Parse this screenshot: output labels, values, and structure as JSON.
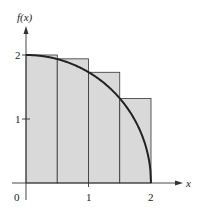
{
  "chart_data": {
    "type": "bar",
    "title": "",
    "xlabel": "x",
    "ylabel": "f(x)",
    "function": "f(x) = sqrt(4 - x^2)",
    "x_ticks": [
      "0",
      "1",
      "2"
    ],
    "y_ticks": [
      "1",
      "2"
    ],
    "xlim": [
      0,
      2
    ],
    "ylim": [
      0,
      2
    ],
    "rectangles": [
      {
        "x0": 0.0,
        "x1": 0.5,
        "height": 2.0
      },
      {
        "x0": 0.5,
        "x1": 1.0,
        "height": 1.94
      },
      {
        "x0": 1.0,
        "x1": 1.5,
        "height": 1.73
      },
      {
        "x0": 1.5,
        "x1": 2.0,
        "height": 1.32
      }
    ],
    "categories": [
      "[0,0.5]",
      "[0.5,1]",
      "[1,1.5]",
      "[1.5,2]"
    ],
    "values": [
      2.0,
      1.94,
      1.73,
      1.32
    ],
    "grid": false,
    "colors": {
      "fill": "#d9d9d9",
      "curve": "#222222",
      "axis": "#333333"
    }
  },
  "labels": {
    "ylabel": "f(x)",
    "xlabel": "x",
    "origin": "0",
    "x1": "1",
    "x2": "2",
    "y1": "1",
    "y2": "2"
  }
}
